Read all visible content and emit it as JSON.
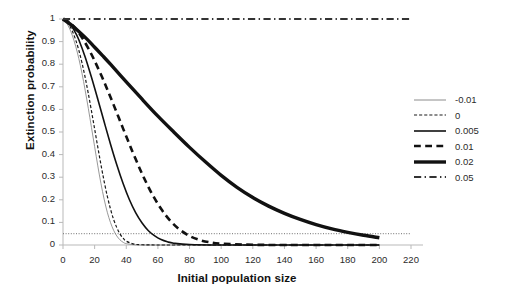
{
  "chart_data": {
    "type": "line",
    "title": "",
    "xlabel": "Initial population size",
    "ylabel": "Extinction probability",
    "xlim": [
      0,
      220
    ],
    "ylim": [
      0,
      1
    ],
    "xticks": [
      "0",
      "20",
      "40",
      "60",
      "80",
      "100",
      "120",
      "140",
      "160",
      "180",
      "200",
      "220"
    ],
    "yticks": [
      "0",
      "0.1",
      "0.2",
      "0.3",
      "0.4",
      "0.5",
      "0.6",
      "0.7",
      "0.8",
      "0.9",
      "1"
    ],
    "grid": false,
    "legend_position": "right",
    "reference_lines": [
      {
        "name": "quasi-extinction-threshold",
        "orientation": "horizontal",
        "y": 0.05,
        "style": "dotted"
      }
    ],
    "series": [
      {
        "name": "-0.01",
        "label": "-0.01",
        "style": "solid",
        "width": 0.9,
        "color": "#8c8c8c",
        "x": [
          0,
          2,
          4,
          6,
          8,
          10,
          12,
          14,
          16,
          18,
          20,
          22,
          24,
          26,
          28,
          30,
          32,
          34,
          36,
          38,
          40,
          45,
          50,
          60,
          80,
          100,
          140,
          200
        ],
        "y": [
          1,
          0.985,
          0.96,
          0.925,
          0.88,
          0.825,
          0.76,
          0.685,
          0.605,
          0.52,
          0.435,
          0.35,
          0.272,
          0.203,
          0.145,
          0.1,
          0.065,
          0.04,
          0.023,
          0.012,
          0.006,
          0.001,
          0,
          0,
          0,
          0,
          0,
          0
        ]
      },
      {
        "name": "0",
        "label": "0",
        "style": "dashed",
        "width": 1.2,
        "color": "#1a1a1a",
        "x": [
          0,
          2,
          4,
          6,
          8,
          10,
          12,
          14,
          16,
          18,
          20,
          22,
          24,
          26,
          28,
          30,
          32,
          34,
          36,
          38,
          40,
          45,
          50,
          60,
          80,
          100,
          140,
          200
        ],
        "y": [
          1,
          0.99,
          0.972,
          0.945,
          0.908,
          0.862,
          0.806,
          0.742,
          0.67,
          0.593,
          0.513,
          0.433,
          0.355,
          0.282,
          0.216,
          0.16,
          0.113,
          0.077,
          0.049,
          0.03,
          0.017,
          0.004,
          0.001,
          0,
          0,
          0,
          0,
          0
        ]
      },
      {
        "name": "0.005",
        "label": "0.005",
        "style": "solid",
        "width": 1.6,
        "color": "#111111",
        "x": [
          0,
          2,
          4,
          6,
          8,
          10,
          14,
          18,
          22,
          26,
          30,
          34,
          38,
          42,
          46,
          50,
          54,
          58,
          62,
          66,
          70,
          80,
          100,
          140,
          200
        ],
        "y": [
          1,
          0.993,
          0.98,
          0.962,
          0.938,
          0.908,
          0.832,
          0.742,
          0.645,
          0.545,
          0.447,
          0.355,
          0.272,
          0.2,
          0.142,
          0.097,
          0.063,
          0.04,
          0.024,
          0.014,
          0.008,
          0.002,
          0,
          0,
          0
        ]
      },
      {
        "name": "0.01",
        "label": "0.01",
        "style": "dashed",
        "width": 2.6,
        "color": "#111111",
        "x": [
          0,
          4,
          8,
          12,
          16,
          20,
          26,
          32,
          38,
          44,
          50,
          56,
          62,
          68,
          74,
          80,
          86,
          92,
          100,
          120,
          150,
          200
        ],
        "y": [
          1,
          0.985,
          0.957,
          0.918,
          0.87,
          0.815,
          0.722,
          0.62,
          0.515,
          0.412,
          0.315,
          0.23,
          0.16,
          0.106,
          0.067,
          0.04,
          0.023,
          0.013,
          0.006,
          0.001,
          0,
          0
        ]
      },
      {
        "name": "0.02",
        "label": "0.02",
        "style": "solid",
        "width": 3.4,
        "color": "#111111",
        "x": [
          0,
          5,
          10,
          15,
          20,
          25,
          30,
          40,
          50,
          60,
          70,
          80,
          90,
          100,
          110,
          120,
          130,
          140,
          150,
          160,
          170,
          180,
          190,
          200
        ],
        "y": [
          1,
          0.975,
          0.945,
          0.912,
          0.875,
          0.838,
          0.8,
          0.722,
          0.645,
          0.57,
          0.5,
          0.432,
          0.368,
          0.308,
          0.255,
          0.21,
          0.172,
          0.14,
          0.113,
          0.09,
          0.071,
          0.056,
          0.043,
          0.032
        ]
      },
      {
        "name": "0.05",
        "label": "0.05",
        "style": "dashdot",
        "width": 1.8,
        "color": "#333333",
        "x": [
          0,
          220
        ],
        "y": [
          1,
          1
        ]
      }
    ]
  }
}
